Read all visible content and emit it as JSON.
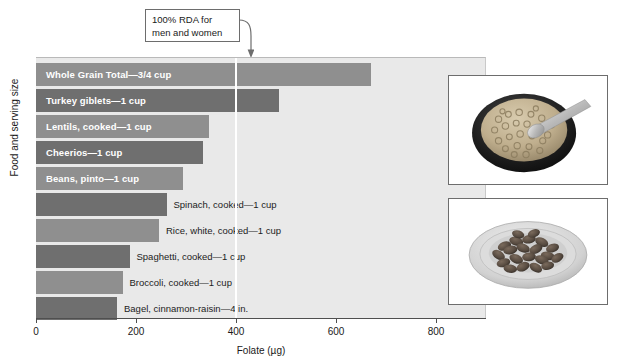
{
  "chart_data": {
    "type": "bar",
    "orientation": "horizontal",
    "title": "",
    "xlabel": "Folate (µg)",
    "ylabel": "Food and serving size",
    "xlim": [
      0,
      900
    ],
    "xticks": [
      0,
      200,
      400,
      600,
      800
    ],
    "xtick_labels": [
      "0",
      "200",
      "400",
      "600",
      "800"
    ],
    "grid": false,
    "legend": "none",
    "categories": [
      "Whole Grain Total—3/4 cup",
      "Turkey giblets—1 cup",
      "Lentils, cooked—1 cup",
      "Cheerios—1 cup",
      "Beans, pinto—1 cup",
      "Spinach, cooked—1 cup",
      "Rice, white, cooked—1 cup",
      "Spaghetti, cooked—1 cup",
      "Broccoli, cooked—1 cup",
      "Bagel, cinnamon-raisin—4 in."
    ],
    "values": [
      670,
      485,
      345,
      333,
      294,
      261,
      246,
      187,
      173,
      162
    ],
    "bar_colors": [
      "#8f8f8f",
      "#6f6f6f",
      "#8f8f8f",
      "#6f6f6f",
      "#8f8f8f",
      "#6f6f6f",
      "#8f8f8f",
      "#6f6f6f",
      "#8f8f8f",
      "#6f6f6f"
    ],
    "label_placement": [
      "inside",
      "inside",
      "inside",
      "inside",
      "inside",
      "outside",
      "outside",
      "outside",
      "outside",
      "outside"
    ],
    "annotations": [
      {
        "name": "rda-reference-line",
        "text_line_1": "100% RDA for",
        "text_line_2": "men and women",
        "value": 400
      }
    ],
    "plot_background": "#e9e9e9"
  },
  "axes": {
    "x_title": "Folate (µg)",
    "y_title": "Food and serving size",
    "x_tick_labels": [
      "0",
      "200",
      "400",
      "600",
      "800"
    ]
  },
  "callout": {
    "line1": "100% RDA for",
    "line2": "men and women"
  },
  "photos": [
    {
      "name": "cereal-bowl-photo",
      "alt": "Bowl of cereal with spoon"
    },
    {
      "name": "beans-plate-photo",
      "alt": "Plate of pinto beans"
    }
  ]
}
